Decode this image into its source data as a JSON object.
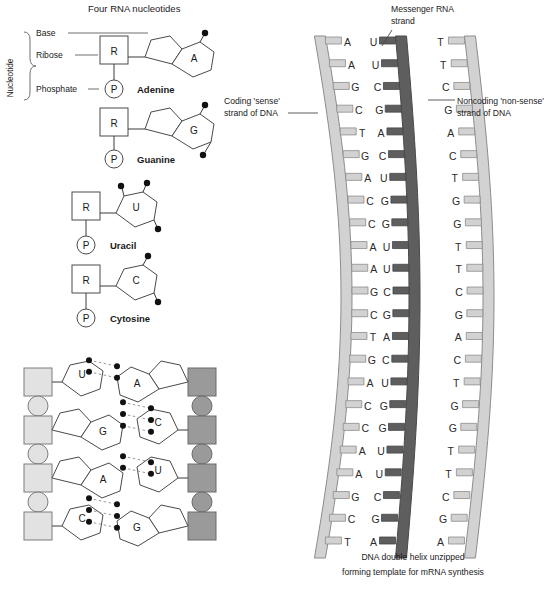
{
  "titles": {
    "nucleotides_heading": "Four RNA nucleotides",
    "mrna_label_line1": "Messenger RNA",
    "mrna_label_line2": "strand",
    "coding_label_line1": "Coding 'sense'",
    "coding_label_line2": "strand of DNA",
    "noncoding_label_line1": "Noncoding 'non-sense'",
    "noncoding_label_line2": "strand of DNA",
    "caption_line1": "DNA double helix unzipped",
    "caption_line2": "forming template for mRNA synthesis"
  },
  "nucleotide_legend": {
    "bracket_label": "Nucleotide",
    "base": "Base",
    "ribose": "Ribose",
    "phosphate": "Phosphate"
  },
  "glyphs": {
    "ribose": "R",
    "phosphate": "P"
  },
  "nucleotides": [
    {
      "name": "Adenine",
      "letter": "A",
      "ring": "purine",
      "dots": 1
    },
    {
      "name": "Guanine",
      "letter": "G",
      "ring": "purine",
      "dots": 2
    },
    {
      "name": "Uracil",
      "letter": "U",
      "ring": "pyrimidine",
      "dots": 3
    },
    {
      "name": "Cytosine",
      "letter": "C",
      "ring": "pyrimidine",
      "dots": 2
    }
  ],
  "base_pair_ladder": {
    "left_strand_type": "RNA",
    "right_strand_type": "DNA",
    "pairs": [
      {
        "left": "U",
        "left_ring": "pyrimidine",
        "right": "A",
        "right_ring": "purine",
        "bonds": 2
      },
      {
        "left": "G",
        "left_ring": "purine",
        "right": "C",
        "right_ring": "pyrimidine",
        "bonds": 3
      },
      {
        "left": "A",
        "left_ring": "purine",
        "right": "U",
        "right_ring": "pyrimidine",
        "bonds": 2
      },
      {
        "left": "C",
        "left_ring": "pyrimidine",
        "right": "G",
        "right_ring": "purine",
        "bonds": 3
      }
    ]
  },
  "helix": {
    "row_count": 23,
    "coding_strand": [
      "A",
      "A",
      "G",
      "C",
      "T",
      "G",
      "A",
      "C",
      "C",
      "A",
      "A",
      "G",
      "C",
      "T",
      "G",
      "A",
      "C",
      "C",
      "A",
      "A",
      "G",
      "C",
      "T"
    ],
    "mrna_strand": [
      "U",
      "U",
      "C",
      "G",
      "A",
      "C",
      "U",
      "G",
      "G",
      "U",
      "U",
      "C",
      "G",
      "A",
      "C",
      "U",
      "G",
      "G",
      "U",
      "U",
      "C",
      "G",
      "A"
    ],
    "noncoding_strand": [
      "T",
      "T",
      "C",
      "G",
      "A",
      "C",
      "T",
      "G",
      "G",
      "T",
      "T",
      "C",
      "G",
      "A",
      "C",
      "T",
      "G",
      "G",
      "T",
      "T",
      "C",
      "G",
      "A"
    ]
  },
  "colors": {
    "backbone_light": "#d2d2d2",
    "backbone_dark": "#5e5e5e",
    "sugar_light": "#e2e2e2",
    "sugar_dark": "#9a9a9a",
    "hydrogen_bond": "#9a9a9a",
    "outline": "#4a4a4a",
    "text": "#1a1a1a"
  }
}
